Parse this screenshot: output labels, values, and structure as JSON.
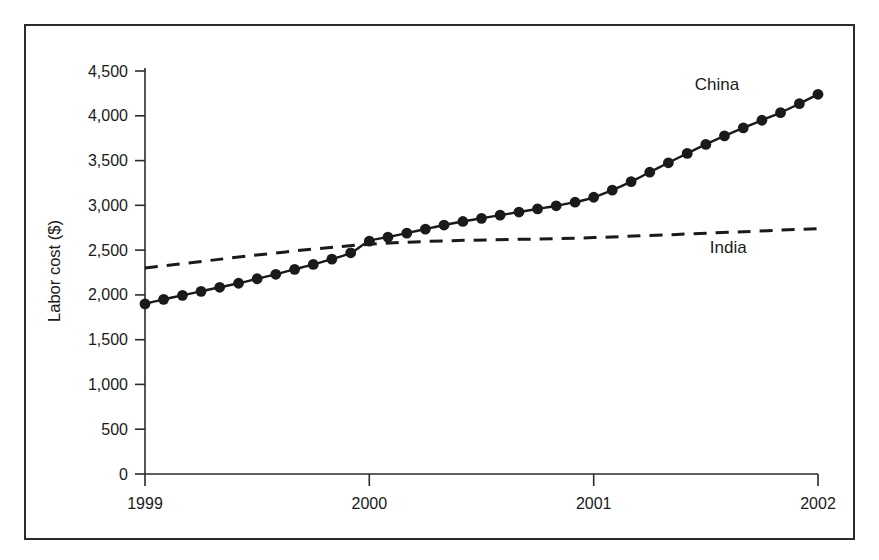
{
  "figure": {
    "background_color": "#ffffff",
    "frame_color": "#2b2b2b",
    "ink_color": "#1a1a1a"
  },
  "chart_data": {
    "type": "line",
    "title": "",
    "xlabel": "",
    "ylabel": "Labor cost ($)",
    "xlim": [
      1999,
      2002
    ],
    "ylim": [
      0,
      4500
    ],
    "grid": false,
    "legend_position": "inline-end-of-line",
    "x_tick_labels": [
      "1999",
      "2000",
      "2001",
      "2002"
    ],
    "x_tick_values": [
      1999,
      2000,
      2001,
      2002
    ],
    "y_tick_labels": [
      "0",
      "500",
      "1,000",
      "1,500",
      "2,000",
      "2,500",
      "3,000",
      "3,500",
      "4,000",
      "4,500"
    ],
    "y_tick_values": [
      0,
      500,
      1000,
      1500,
      2000,
      2500,
      3000,
      3500,
      4000,
      4500
    ],
    "series": [
      {
        "name": "China",
        "label": "China",
        "style": "solid",
        "markers": "filled-circle",
        "x": [
          1999.0,
          1999.083,
          1999.167,
          1999.25,
          1999.333,
          1999.417,
          1999.5,
          1999.583,
          1999.667,
          1999.75,
          1999.833,
          1999.917,
          2000.0,
          2000.083,
          2000.167,
          2000.25,
          2000.333,
          2000.417,
          2000.5,
          2000.583,
          2000.667,
          2000.75,
          2000.833,
          2000.917,
          2001.0,
          2001.083,
          2001.167,
          2001.25,
          2001.333,
          2001.417,
          2001.5,
          2001.583,
          2001.667,
          2001.75,
          2001.833,
          2001.917,
          2002.0
        ],
        "values": [
          1900,
          1950,
          1995,
          2040,
          2085,
          2130,
          2180,
          2230,
          2285,
          2340,
          2400,
          2470,
          2600,
          2645,
          2690,
          2735,
          2780,
          2820,
          2855,
          2890,
          2925,
          2960,
          2995,
          3035,
          3090,
          3170,
          3265,
          3370,
          3475,
          3580,
          3680,
          3775,
          3865,
          3950,
          4035,
          4135,
          4240
        ]
      },
      {
        "name": "India",
        "label": "India",
        "style": "dashed",
        "markers": "none",
        "x": [
          1999.0,
          2000.0,
          2001.0,
          2002.0
        ],
        "values": [
          2300,
          2565,
          2640,
          2740
        ]
      }
    ],
    "annotations": [
      {
        "text": "China",
        "x": 2001.55,
        "y": 4290
      },
      {
        "text": "India",
        "x": 2001.6,
        "y": 2470
      }
    ]
  }
}
